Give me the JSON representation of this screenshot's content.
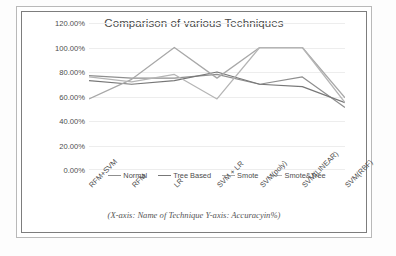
{
  "chart_data": {
    "type": "line",
    "title": "Comparison of various Techniques",
    "caption": "(X-axis: Name of Technique  Y-axis: Accuracyin%)",
    "xlabel": "Name of Technique",
    "ylabel": "Accuracyin%",
    "grid": true,
    "legend_position": "bottom",
    "ylim": [
      0,
      120
    ],
    "ytick_labels": [
      "120.00%",
      "100.00%",
      "80.00%",
      "60.00%",
      "40.00%",
      "20.00%",
      "0.00%"
    ],
    "ytick_values": [
      120,
      100,
      80,
      60,
      40,
      20,
      0
    ],
    "categories": [
      "RFM+SVM",
      "RFM",
      "LR",
      "SVM + LR",
      "SVM(poly)",
      "SVM(LINEAR)",
      "SVM(RBF)"
    ],
    "series": [
      {
        "name": "Normal",
        "color": "#8f8f8f",
        "values": [
          77,
          75,
          75,
          78,
          70,
          76,
          51
        ]
      },
      {
        "name": "Tree Based",
        "color": "#777777",
        "values": [
          73,
          70,
          73,
          80,
          70,
          68,
          55
        ]
      },
      {
        "name": "Smote",
        "color": "#a8a8a8",
        "values": [
          58,
          74,
          100,
          75,
          100,
          100,
          59
        ]
      },
      {
        "name": "Smote&Tree",
        "color": "#b5b5b5",
        "values": [
          76,
          72,
          78,
          58,
          100,
          100,
          55
        ]
      }
    ]
  },
  "colors": {
    "plot_background": "#ffffff",
    "gridline": "#ededed",
    "axis_text": "#4d4d4d",
    "title_text": "#4a4a4a",
    "chart_border": "#7d7d7d",
    "page_border": "#b9b9b9"
  }
}
